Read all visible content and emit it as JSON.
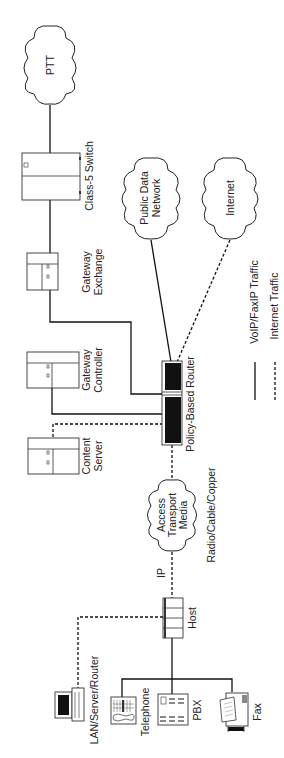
{
  "diagram": {
    "orientation": "rotated-90-ccw",
    "nodes": {
      "ptt": {
        "label": "PTT",
        "type": "cloud"
      },
      "class5_switch": {
        "label": "Class-5 Switch",
        "type": "switch"
      },
      "public_data_network": {
        "label_line1": "Public Data",
        "label_line2": "Network",
        "type": "cloud"
      },
      "internet": {
        "label": "Internet",
        "type": "cloud"
      },
      "gateway_exchange": {
        "label_line1": "Gateway",
        "label_line2": "Exchange",
        "type": "server"
      },
      "gateway_controller": {
        "label_line1": "Gateway",
        "label_line2": "Controller",
        "type": "server"
      },
      "content_server": {
        "label_line1": "Content",
        "label_line2": "Server",
        "type": "server"
      },
      "policy_router": {
        "label": "Policy-Based Router",
        "type": "router"
      },
      "access_transport": {
        "label_line1": "Access",
        "label_line2": "Transport",
        "label_line3": "Media",
        "type": "cloud"
      },
      "media_note": {
        "label": "Radio/Cable/Copper"
      },
      "ip_label": {
        "label": "IP"
      },
      "host": {
        "label": "Host",
        "type": "host"
      },
      "lan": {
        "label": "LAN/Server/Router",
        "type": "computer"
      },
      "telephone": {
        "label": "Telephone",
        "type": "telephone"
      },
      "pbx": {
        "label": "PBX",
        "type": "pbx"
      },
      "fax": {
        "label": "Fax",
        "type": "fax"
      }
    },
    "legend": {
      "solid": {
        "label": "VoIP/FaxIP Traffic",
        "style": "solid"
      },
      "dashed": {
        "label": "Internet Traffic",
        "style": "dashed"
      }
    },
    "colors": {
      "line": "#111111",
      "background": "#ffffff",
      "router_fill": "#111111"
    }
  }
}
